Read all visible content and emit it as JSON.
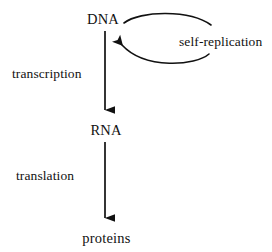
{
  "diagram": {
    "background_color": "#ffffff",
    "stroke_color": "#111111",
    "text_color": "#111111",
    "nodes": [
      {
        "id": "dna",
        "label": "DNA"
      },
      {
        "id": "rna",
        "label": "RNA"
      },
      {
        "id": "proteins",
        "label": "proteins"
      }
    ],
    "edges": [
      {
        "id": "transcription",
        "label": "transcription",
        "from": "dna",
        "to": "rna",
        "style": "straight-arrow",
        "direction": "down"
      },
      {
        "id": "translation",
        "label": "translation",
        "from": "rna",
        "to": "proteins",
        "style": "straight-arrow",
        "direction": "down"
      },
      {
        "id": "self-replication",
        "label": "self-replication",
        "from": "dna",
        "to": "dna",
        "style": "curved-loop-arrow",
        "direction": "counterclockwise"
      }
    ]
  }
}
